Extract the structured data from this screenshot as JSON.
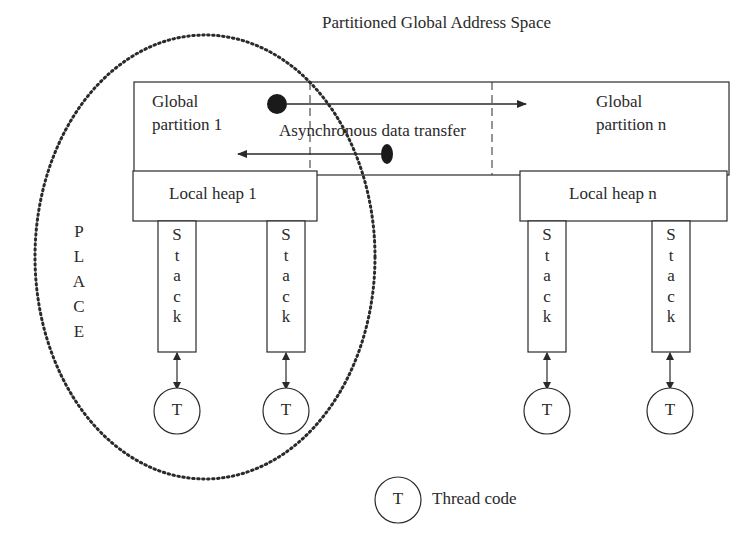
{
  "title": "Partitioned Global Address Space",
  "global_partitions": [
    {
      "line1": "Global",
      "line2": "partition 1"
    },
    {
      "line1": "Global",
      "line2": "partition n"
    }
  ],
  "transfer_label": "Asynchronous data transfer",
  "local_heaps": [
    "Local heap 1",
    "Local heap n"
  ],
  "stack_letters": [
    "S",
    "t",
    "a",
    "c",
    "k"
  ],
  "thread_symbol": "T",
  "place_letters": [
    "P",
    "L",
    "A",
    "C",
    "E"
  ],
  "legend": {
    "symbol": "T",
    "label": "Thread code"
  },
  "colors": {
    "line": "#2a2a2a",
    "background": "#ffffff"
  }
}
